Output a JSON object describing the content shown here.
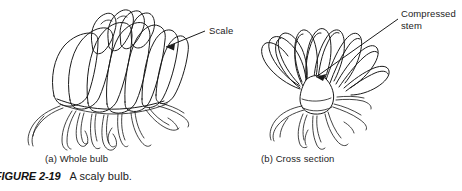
{
  "figure": {
    "caption_number": "FIGURE 2-19",
    "caption_text": "A scaly bulb.",
    "caption_number_truncated_left": true
  },
  "panels": [
    {
      "id": "a",
      "caption": "(a) Whole bulb",
      "subject": "scaly-bulb-whole",
      "callout": {
        "label": "Scale",
        "label_lines": [
          "Scale"
        ],
        "leader": "arrow pointing left-down from label into outer bulb scale"
      }
    },
    {
      "id": "b",
      "caption": "(b) Cross section",
      "subject": "scaly-bulb-cross-section",
      "callout": {
        "label": "Compressed stem",
        "label_lines": [
          "Compressed",
          "stem"
        ],
        "leader": "arrow pointing left-down from label into basal plate at bulb center"
      }
    }
  ],
  "labels": {
    "scale": "Scale",
    "compressed_line1": "Compressed",
    "compressed_line2": "stem"
  },
  "colors": {
    "ink": "#1b1b1b",
    "background": "#ffffff",
    "text": "#1c1c1c"
  }
}
